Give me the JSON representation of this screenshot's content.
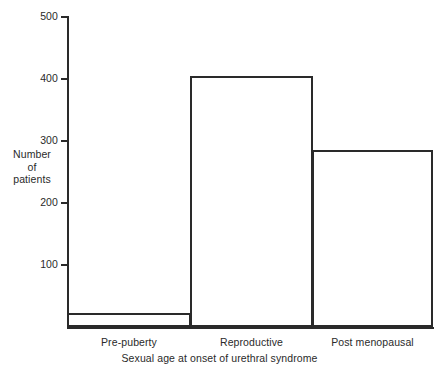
{
  "chart_data": {
    "type": "bar",
    "title": "",
    "xlabel": "Sexual age at onset of urethral syndrome",
    "ylabel": "Number of patients",
    "ylabel_lines": [
      "Number",
      "of",
      "patients"
    ],
    "categories": [
      "Pre-puberty",
      "Reproductive",
      "Post menopausal"
    ],
    "values": [
      22,
      403,
      285
    ],
    "ylim": [
      0,
      500
    ],
    "yticks": [
      100,
      200,
      300,
      400,
      500
    ],
    "ytick_labels": [
      "100",
      "200",
      "300",
      "400",
      "500"
    ],
    "grid": false,
    "legend": "none",
    "bar_style": "outlined-unfilled-adjacent",
    "colors": {
      "ink": "#2a2a2a",
      "background": "#ffffff",
      "bar_fill": "#ffffff",
      "bar_edge": "#2a2a2a"
    }
  }
}
